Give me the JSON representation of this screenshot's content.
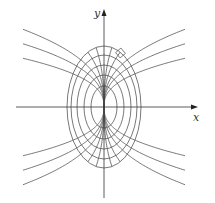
{
  "figure": {
    "axes": {
      "x_label": "x",
      "y_label": "y"
    },
    "ellipses": {
      "center": [
        104,
        107
      ],
      "semi_axes": [
        [
          13,
          21
        ],
        [
          20,
          32
        ],
        [
          27,
          42
        ],
        [
          33,
          52
        ],
        [
          37,
          61
        ]
      ]
    },
    "trajectories": {
      "exponent": 0.4,
      "coefficients": [
        8.4,
        10.9,
        13.4,
        18,
        26
      ]
    },
    "right_angle_marker": {
      "position": [
        120,
        52
      ]
    },
    "colors": {
      "curve": "#555555",
      "axis": "#333333"
    }
  }
}
